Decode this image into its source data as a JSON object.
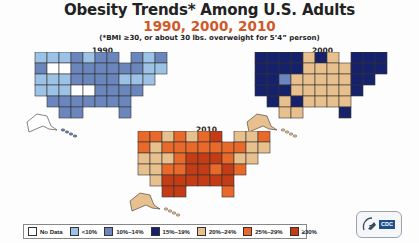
{
  "header": {
    "title": "Obesity Trends* Among U.S. Adults",
    "years": "1990, 2000, 2010",
    "note": "(*BMI ≥30, or about 30 lbs. overweight for 5’4” person)"
  },
  "maps": [
    {
      "year": "1990",
      "label": "1990",
      "dominant_category": "10%–14%"
    },
    {
      "year": "2000",
      "label": "2000",
      "dominant_category": "20%–24%"
    },
    {
      "year": "2010",
      "label": "2010",
      "dominant_category": "25%–29%"
    }
  ],
  "legend": {
    "items": [
      {
        "label": "No Data",
        "color": "#ffffff"
      },
      {
        "label": "<10%",
        "color": "#9cc3e6"
      },
      {
        "label": "10%–14%",
        "color": "#6b86bd"
      },
      {
        "label": "15%–19%",
        "color": "#16216b"
      },
      {
        "label": "20%–24%",
        "color": "#e8c08e"
      },
      {
        "label": "25%–29%",
        "color": "#e8692a"
      },
      {
        "label": "≥30%",
        "color": "#c43c16"
      }
    ]
  },
  "logo": {
    "text": "CDC"
  }
}
